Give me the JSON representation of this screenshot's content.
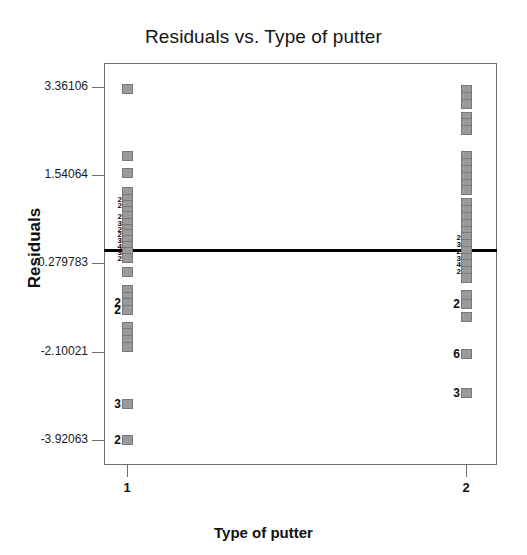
{
  "chart_data": {
    "type": "scatter",
    "title": "Residuals vs. Type of putter",
    "xlabel": "Type of putter",
    "ylabel": "Residuals",
    "grid": false,
    "legend": "none",
    "xlim": [
      0.5,
      2.5
    ],
    "ylim": [
      -4.5,
      4.0
    ],
    "x_ticks": [
      {
        "label": "1",
        "value": 1
      },
      {
        "label": "2",
        "value": 2
      }
    ],
    "y_ticks": [
      {
        "label": "3.36106",
        "value": 3.36106
      },
      {
        "label": "1.54064",
        "value": 1.54064
      },
      {
        "label": "-0.279783",
        "value": -0.279783
      },
      {
        "label": "-2.10021",
        "value": -2.10021
      },
      {
        "label": "-3.92063",
        "value": -3.92063
      }
    ],
    "reference_line": {
      "orientation": "horizontal",
      "value": 0.0,
      "color": "#000000"
    },
    "marker_color": "#9a9a9a",
    "series": [
      {
        "name": "Type of putter = 1",
        "x": 1,
        "points": [
          {
            "y": 3.33,
            "count": 1,
            "count_label": ""
          },
          {
            "y": 1.93,
            "count": 1,
            "count_label": ""
          },
          {
            "y": 1.58,
            "count": 1,
            "count_label": ""
          },
          {
            "y": 1.19,
            "count": 1,
            "count_label": ""
          },
          {
            "y": 1.05,
            "count": 2,
            "count_label": "2"
          },
          {
            "y": 0.93,
            "count": 2,
            "count_label": "2"
          },
          {
            "y": 0.81,
            "count": 1,
            "count_label": ""
          },
          {
            "y": 0.69,
            "count": 2,
            "count_label": "2"
          },
          {
            "y": 0.56,
            "count": 3,
            "count_label": "3"
          },
          {
            "y": 0.44,
            "count": 2,
            "count_label": "2"
          },
          {
            "y": 0.32,
            "count": 2,
            "count_label": "2"
          },
          {
            "y": 0.2,
            "count": 3,
            "count_label": "3"
          },
          {
            "y": 0.08,
            "count": 4,
            "count_label": "4"
          },
          {
            "y": -0.04,
            "count": 3,
            "count_label": "3"
          },
          {
            "y": -0.16,
            "count": 2,
            "count_label": "2"
          },
          {
            "y": -0.45,
            "count": 1,
            "count_label": ""
          },
          {
            "y": -0.83,
            "count": 1,
            "count_label": ""
          },
          {
            "y": -0.97,
            "count": 1,
            "count_label": ""
          },
          {
            "y": -1.1,
            "count": 2,
            "count_label": "2"
          },
          {
            "y": -1.24,
            "count": 2,
            "count_label": "2"
          },
          {
            "y": -1.58,
            "count": 1,
            "count_label": ""
          },
          {
            "y": -1.72,
            "count": 1,
            "count_label": ""
          },
          {
            "y": -1.86,
            "count": 1,
            "count_label": ""
          },
          {
            "y": -2.0,
            "count": 1,
            "count_label": ""
          },
          {
            "y": -3.18,
            "count": 3,
            "count_label": "3"
          },
          {
            "y": -3.92,
            "count": 2,
            "count_label": "2"
          }
        ]
      },
      {
        "name": "Type of putter = 2",
        "x": 2,
        "points": [
          {
            "y": 3.3,
            "count": 1,
            "count_label": ""
          },
          {
            "y": 3.16,
            "count": 1,
            "count_label": ""
          },
          {
            "y": 3.02,
            "count": 1,
            "count_label": ""
          },
          {
            "y": 2.75,
            "count": 1,
            "count_label": ""
          },
          {
            "y": 2.61,
            "count": 1,
            "count_label": ""
          },
          {
            "y": 2.47,
            "count": 1,
            "count_label": ""
          },
          {
            "y": 1.93,
            "count": 1,
            "count_label": ""
          },
          {
            "y": 1.79,
            "count": 1,
            "count_label": ""
          },
          {
            "y": 1.65,
            "count": 1,
            "count_label": ""
          },
          {
            "y": 1.51,
            "count": 1,
            "count_label": ""
          },
          {
            "y": 1.37,
            "count": 1,
            "count_label": ""
          },
          {
            "y": 1.23,
            "count": 1,
            "count_label": ""
          },
          {
            "y": 0.96,
            "count": 1,
            "count_label": ""
          },
          {
            "y": 0.82,
            "count": 1,
            "count_label": ""
          },
          {
            "y": 0.68,
            "count": 1,
            "count_label": ""
          },
          {
            "y": 0.54,
            "count": 1,
            "count_label": ""
          },
          {
            "y": 0.4,
            "count": 1,
            "count_label": ""
          },
          {
            "y": 0.26,
            "count": 2,
            "count_label": "2"
          },
          {
            "y": 0.12,
            "count": 3,
            "count_label": "3"
          },
          {
            "y": -0.02,
            "count": 2,
            "count_label": "2"
          },
          {
            "y": -0.16,
            "count": 3,
            "count_label": "3"
          },
          {
            "y": -0.3,
            "count": 4,
            "count_label": "4"
          },
          {
            "y": -0.44,
            "count": 2,
            "count_label": "2"
          },
          {
            "y": -0.58,
            "count": 1,
            "count_label": ""
          },
          {
            "y": -0.92,
            "count": 1,
            "count_label": ""
          },
          {
            "y": -1.12,
            "count": 2,
            "count_label": "2"
          },
          {
            "y": -1.38,
            "count": 1,
            "count_label": ""
          },
          {
            "y": -2.14,
            "count": 6,
            "count_label": "6"
          },
          {
            "y": -2.96,
            "count": 3,
            "count_label": "3"
          }
        ]
      }
    ]
  }
}
